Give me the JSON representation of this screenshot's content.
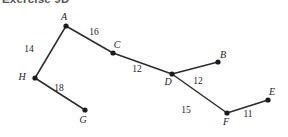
{
  "heading": {
    "text": "Exercise 9D"
  },
  "figure": {
    "type": "labelled-path-diagram",
    "width": 288,
    "height": 137,
    "background_color": "#ffffff",
    "ink_color": "#2b2b2b",
    "vertices": [
      {
        "id": "A",
        "label": "A",
        "x": 66,
        "y": 26,
        "label_dx": -2,
        "label_dy": -6
      },
      {
        "id": "B",
        "label": "B",
        "x": 218,
        "y": 62,
        "label_dx": 5,
        "label_dy": -4
      },
      {
        "id": "C",
        "label": "C",
        "x": 113,
        "y": 53,
        "label_dx": 4,
        "label_dy": -5
      },
      {
        "id": "D",
        "label": "D",
        "x": 172,
        "y": 74,
        "label_dx": -4,
        "label_dy": 11
      },
      {
        "id": "E",
        "label": "E",
        "x": 268,
        "y": 100,
        "label_dx": 4,
        "label_dy": -5
      },
      {
        "id": "F",
        "label": "F",
        "x": 227,
        "y": 113,
        "label_dx": -1,
        "label_dy": 12
      },
      {
        "id": "G",
        "label": "G",
        "x": 85,
        "y": 110,
        "label_dx": -2,
        "label_dy": 13
      },
      {
        "id": "H",
        "label": "H",
        "x": 35,
        "y": 78,
        "label_dx": -13,
        "label_dy": 2
      }
    ],
    "edges": [
      {
        "from": "H",
        "to": "A",
        "length": "14",
        "label_x": 29,
        "label_y": 52
      },
      {
        "from": "A",
        "to": "C",
        "length": "16",
        "label_x": 94,
        "label_y": 35
      },
      {
        "from": "C",
        "to": "D",
        "length": "12",
        "label_x": 137,
        "label_y": 72
      },
      {
        "from": "D",
        "to": "B",
        "length": "12",
        "label_x": 198,
        "label_y": 84
      },
      {
        "from": "D",
        "to": "F",
        "length": "15",
        "label_x": 186,
        "label_y": 113
      },
      {
        "from": "F",
        "to": "E",
        "length": "11",
        "label_x": 248,
        "label_y": 117
      },
      {
        "from": "H",
        "to": "G",
        "length": "18",
        "label_x": 59,
        "label_y": 91
      }
    ]
  }
}
